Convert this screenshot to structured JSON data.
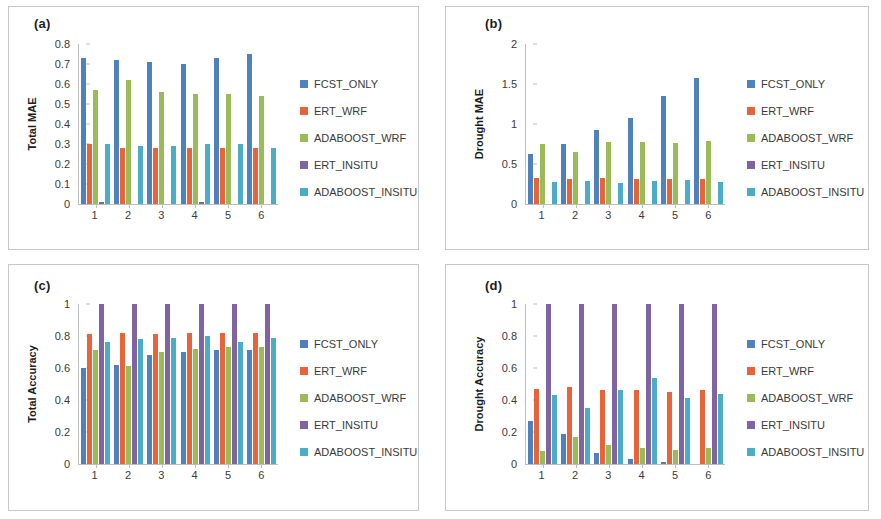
{
  "series_names": [
    "FCST_ONLY",
    "ERT_WRF",
    "ADABOOST_WRF",
    "ERT_INSITU",
    "ADABOOST_INSITU"
  ],
  "series_colors": [
    "#4f81bd",
    "#e8633a",
    "#9bbb59",
    "#8064a2",
    "#4bacc6"
  ],
  "categories": [
    "1",
    "2",
    "3",
    "4",
    "5",
    "6"
  ],
  "xlabel": "Lead time (month)",
  "panels": [
    {
      "label": "(a)",
      "ylabel": "Total MAE",
      "yticks": [
        "0",
        "0.1",
        "0.2",
        "0.3",
        "0.4",
        "0.5",
        "0.6",
        "0.7",
        "0.8"
      ]
    },
    {
      "label": "(b)",
      "ylabel": "Drought MAE",
      "yticks": [
        "0",
        "0.5",
        "1",
        "1.5",
        "2"
      ]
    },
    {
      "label": "(c)",
      "ylabel": "Total Accuracy",
      "yticks": [
        "0",
        "0.2",
        "0.4",
        "0.6",
        "0.8",
        "1"
      ]
    },
    {
      "label": "(d)",
      "ylabel": "Drought Accuracy",
      "yticks": [
        "0",
        "0.2",
        "0.4",
        "0.6",
        "0.8",
        "1"
      ]
    }
  ],
  "chart_data": [
    {
      "type": "bar",
      "title": "(a)",
      "xlabel": "Lead time (month)",
      "ylabel": "Total MAE",
      "categories": [
        "1",
        "2",
        "3",
        "4",
        "5",
        "6"
      ],
      "ylim": [
        0,
        0.8
      ],
      "ytick_step": 0.1,
      "grid": false,
      "legend_position": "right",
      "series": [
        {
          "name": "FCST_ONLY",
          "values": [
            0.73,
            0.72,
            0.71,
            0.7,
            0.73,
            0.75
          ]
        },
        {
          "name": "ERT_WRF",
          "values": [
            0.3,
            0.28,
            0.28,
            0.28,
            0.28,
            0.28
          ]
        },
        {
          "name": "ADABOOST_WRF",
          "values": [
            0.57,
            0.62,
            0.56,
            0.55,
            0.55,
            0.54
          ]
        },
        {
          "name": "ERT_INSITU",
          "values": [
            0.01,
            0.0,
            0.0,
            0.01,
            0.0,
            0.0
          ]
        },
        {
          "name": "ADABOOST_INSITU",
          "values": [
            0.3,
            0.29,
            0.29,
            0.3,
            0.3,
            0.28
          ]
        }
      ]
    },
    {
      "type": "bar",
      "title": "(b)",
      "xlabel": "Lead time (month)",
      "ylabel": "Drought MAE",
      "categories": [
        "1",
        "2",
        "3",
        "4",
        "5",
        "6"
      ],
      "ylim": [
        0,
        2
      ],
      "ytick_step": 0.5,
      "grid": false,
      "legend_position": "right",
      "series": [
        {
          "name": "FCST_ONLY",
          "values": [
            0.62,
            0.75,
            0.92,
            1.08,
            1.35,
            1.58
          ]
        },
        {
          "name": "ERT_WRF",
          "values": [
            0.32,
            0.31,
            0.33,
            0.31,
            0.31,
            0.31
          ]
        },
        {
          "name": "ADABOOST_WRF",
          "values": [
            0.75,
            0.65,
            0.77,
            0.77,
            0.76,
            0.79
          ]
        },
        {
          "name": "ERT_INSITU",
          "values": [
            0.0,
            0.0,
            0.0,
            0.0,
            0.0,
            0.0
          ]
        },
        {
          "name": "ADABOOST_INSITU",
          "values": [
            0.28,
            0.29,
            0.26,
            0.29,
            0.3,
            0.27
          ]
        }
      ]
    },
    {
      "type": "bar",
      "title": "(c)",
      "xlabel": "Lead time (month)",
      "ylabel": "Total Accuracy",
      "categories": [
        "1",
        "2",
        "3",
        "4",
        "5",
        "6"
      ],
      "ylim": [
        0,
        1
      ],
      "ytick_step": 0.2,
      "grid": false,
      "legend_position": "right",
      "series": [
        {
          "name": "FCST_ONLY",
          "values": [
            0.6,
            0.62,
            0.68,
            0.7,
            0.71,
            0.71
          ]
        },
        {
          "name": "ERT_WRF",
          "values": [
            0.81,
            0.82,
            0.81,
            0.82,
            0.82,
            0.82
          ]
        },
        {
          "name": "ADABOOST_WRF",
          "values": [
            0.71,
            0.61,
            0.7,
            0.72,
            0.73,
            0.73
          ]
        },
        {
          "name": "ERT_INSITU",
          "values": [
            1.0,
            1.0,
            1.0,
            1.0,
            1.0,
            1.0
          ]
        },
        {
          "name": "ADABOOST_INSITU",
          "values": [
            0.76,
            0.78,
            0.79,
            0.8,
            0.76,
            0.79
          ]
        }
      ]
    },
    {
      "type": "bar",
      "title": "(d)",
      "xlabel": "Lead time (month)",
      "ylabel": "Drought Accuracy",
      "categories": [
        "1",
        "2",
        "3",
        "4",
        "5",
        "6"
      ],
      "ylim": [
        0,
        1
      ],
      "ytick_step": 0.2,
      "grid": false,
      "legend_position": "right",
      "series": [
        {
          "name": "FCST_ONLY",
          "values": [
            0.27,
            0.19,
            0.07,
            0.03,
            0.01,
            0.0
          ]
        },
        {
          "name": "ERT_WRF",
          "values": [
            0.47,
            0.48,
            0.46,
            0.46,
            0.45,
            0.46
          ]
        },
        {
          "name": "ADABOOST_WRF",
          "values": [
            0.08,
            0.17,
            0.12,
            0.1,
            0.09,
            0.1
          ]
        },
        {
          "name": "ERT_INSITU",
          "values": [
            1.0,
            1.0,
            1.0,
            1.0,
            1.0,
            1.0
          ]
        },
        {
          "name": "ADABOOST_INSITU",
          "values": [
            0.43,
            0.35,
            0.46,
            0.54,
            0.41,
            0.44
          ]
        }
      ]
    }
  ]
}
